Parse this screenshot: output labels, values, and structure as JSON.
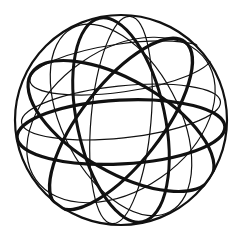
{
  "illustration": {
    "subject": "wireframe-sphere",
    "stroke_color": "#111111",
    "background": "#ffffff",
    "center": [
      121,
      120
    ],
    "radius": 106,
    "circles": [
      {
        "name": "outline",
        "rx": 106,
        "ry": 105,
        "rot": 0,
        "w": 2.2
      },
      {
        "name": "thick-equator",
        "rx": 104,
        "ry": 32,
        "rot": -3,
        "w": 3.2,
        "cy_off": 12
      },
      {
        "name": "thin-latitude-upper",
        "rx": 92,
        "ry": 24,
        "rot": -8,
        "w": 1.2,
        "cy_off": -52
      },
      {
        "name": "thin-latitude-lower",
        "rx": 100,
        "ry": 26,
        "rot": -6,
        "w": 1.2,
        "cy_off": -8
      },
      {
        "name": "thick-tilted-band-a",
        "rx": 104,
        "ry": 46,
        "rot": 30,
        "w": 3.2,
        "cy_off": 6
      },
      {
        "name": "thick-tilted-band-b",
        "rx": 104,
        "ry": 40,
        "rot": -52,
        "w": 3.2,
        "cy_off": 4
      },
      {
        "name": "thin-meridian-a",
        "rx": 104,
        "ry": 30,
        "rot": 95,
        "w": 1.2,
        "cy_off": 0
      },
      {
        "name": "thin-meridian-b",
        "rx": 104,
        "ry": 58,
        "rot": 62,
        "w": 1.2,
        "cy_off": 0
      },
      {
        "name": "thick-meridian",
        "rx": 104,
        "ry": 44,
        "rot": 78,
        "w": 3.0,
        "cy_off": 0
      },
      {
        "name": "thin-oblique",
        "rx": 104,
        "ry": 70,
        "rot": -35,
        "w": 1.2,
        "cy_off": 0
      }
    ]
  }
}
